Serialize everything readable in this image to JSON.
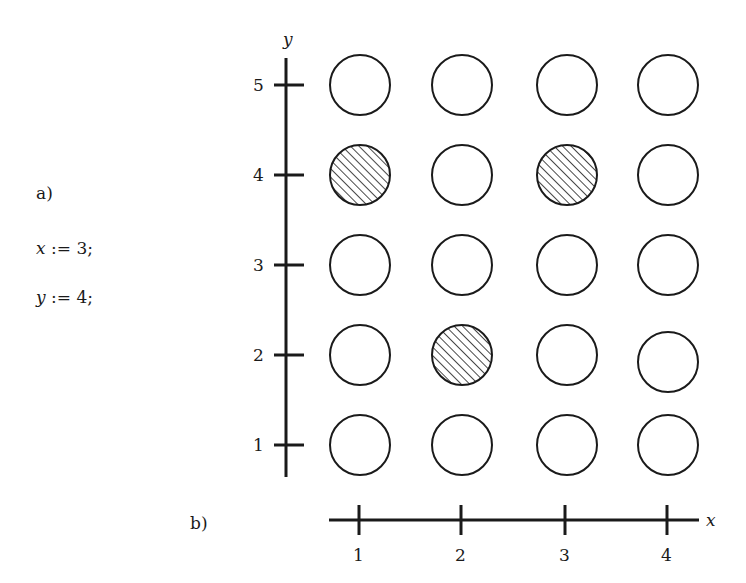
{
  "labels": {
    "part_a": "a)",
    "part_b": "b)"
  },
  "code": [
    {
      "var": "x",
      "op": ":=",
      "value": "3;",
      "text": "x := 3;"
    },
    {
      "var": "y",
      "op": ":=",
      "value": "4;",
      "text": "y := 4;"
    }
  ],
  "axes": {
    "x_name": "x",
    "y_name": "y",
    "x_ticks": [
      "1",
      "2",
      "3",
      "4"
    ],
    "y_ticks": [
      "5",
      "4",
      "3",
      "2",
      "1"
    ]
  },
  "grid": {
    "columns": 4,
    "rows": 5,
    "hatched": [
      {
        "x": 1,
        "y": 4
      },
      {
        "x": 3,
        "y": 4
      },
      {
        "x": 2,
        "y": 2
      }
    ]
  },
  "colors": {
    "stroke": "#1a1a1a",
    "background": "#ffffff"
  }
}
